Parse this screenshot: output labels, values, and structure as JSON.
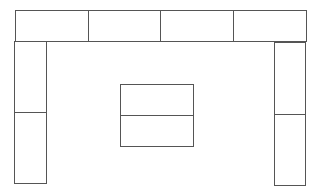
{
  "diagram": {
    "line_color": "#555555",
    "background": "#ffffff",
    "top_row": [
      {
        "x": 15,
        "y": 10,
        "w": 74,
        "h": 32
      },
      {
        "x": 88,
        "y": 10,
        "w": 73,
        "h": 32
      },
      {
        "x": 160,
        "y": 10,
        "w": 74,
        "h": 32
      },
      {
        "x": 233,
        "y": 10,
        "w": 74,
        "h": 32
      }
    ],
    "left_column": [
      {
        "x": 14,
        "y": 41,
        "w": 33,
        "h": 72
      },
      {
        "x": 14,
        "y": 112,
        "w": 33,
        "h": 72
      }
    ],
    "right_column": [
      {
        "x": 274,
        "y": 42,
        "w": 32,
        "h": 73
      },
      {
        "x": 274,
        "y": 114,
        "w": 32,
        "h": 72
      }
    ],
    "center_block": [
      {
        "x": 120,
        "y": 84,
        "w": 74,
        "h": 32
      },
      {
        "x": 120,
        "y": 115,
        "w": 74,
        "h": 32
      }
    ]
  }
}
